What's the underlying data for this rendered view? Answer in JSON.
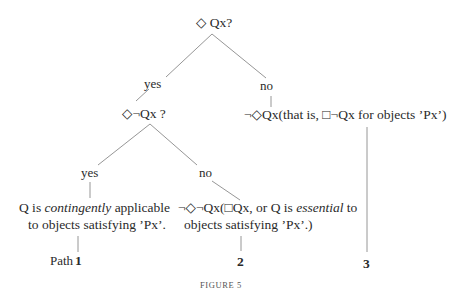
{
  "figure": {
    "caption": "FIGURE 5",
    "root": {
      "question": "◇ Qx?"
    },
    "branch_yes": {
      "label": "yes",
      "question": "◇¬Qx ?",
      "branch_yes": {
        "label": "yes",
        "conclusion_line1_pre": "Q is ",
        "conclusion_line1_em": "contingently",
        "conclusion_line1_post": " applicable",
        "conclusion_line2": "to objects satisfying ʼPxʼ.",
        "path_word": "Path",
        "path_number": "1"
      },
      "branch_no": {
        "label": "no",
        "conclusion_line1_pre": "¬◇¬Qx(□Qx, or Q is ",
        "conclusion_line1_em": "essential",
        "conclusion_line1_post": " to",
        "conclusion_line2": "objects satisfying ʼPxʼ.)",
        "path_number": "2"
      }
    },
    "branch_no": {
      "label": "no",
      "conclusion": "¬◇Qx(that is, □¬Qx for objects ʼPxʼ)",
      "path_number": "3"
    },
    "colors": {
      "line": "#8a8a8a",
      "text": "#2a2a2a"
    }
  }
}
